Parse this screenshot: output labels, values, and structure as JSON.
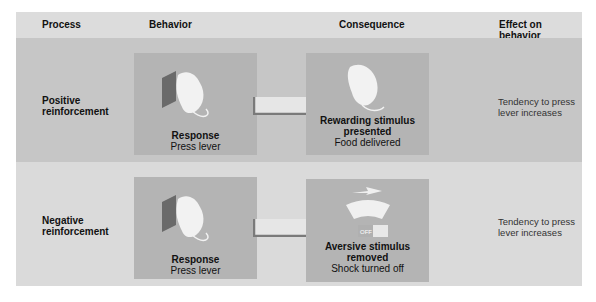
{
  "headers": {
    "process": "Process",
    "behavior": "Behavior",
    "consequence": "Consequence",
    "effect": "Effect on behavior"
  },
  "rows": [
    {
      "process": "Positive reinforcement",
      "behavior": {
        "title": "Response",
        "subtitle": "Press lever",
        "icon": "rat-pressing-lever-icon"
      },
      "consequence": {
        "title": "Rewarding stimulus presented",
        "subtitle": "Food delivered",
        "icon": "rat-eating-icon"
      },
      "effect": "Tendency to press lever increases"
    },
    {
      "process": "Negative reinforcement",
      "behavior": {
        "title": "Response",
        "subtitle": "Press lever",
        "icon": "rat-pressing-lever-icon"
      },
      "consequence": {
        "title": "Aversive stimulus removed",
        "subtitle": "Shock turned off",
        "icon": "shock-off-icon",
        "switch_label": "OFF"
      },
      "effect": "Tendency to press lever increases"
    }
  ],
  "colors": {
    "header_bg": "#dcdcdc",
    "row1_bg": "#c6c6c6",
    "row2_bg": "#dadada",
    "panel_bg": "#b4b4b4",
    "lever": "#6a6a6a"
  }
}
